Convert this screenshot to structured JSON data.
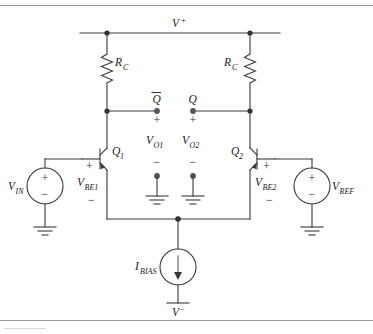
{
  "figure": {
    "accent_color": "#3a3a3a",
    "background_color": "#ffffff"
  },
  "rails": {
    "positive": {
      "label": "V",
      "sign": "+",
      "name": "v-plus-rail"
    },
    "negative": {
      "label": "V",
      "sign": "−",
      "name": "v-minus-rail"
    }
  },
  "resistors": [
    {
      "id": "rc-left",
      "label": "R",
      "subscript": "C"
    },
    {
      "id": "rc-right",
      "label": "R",
      "subscript": "C"
    }
  ],
  "transistors": [
    {
      "id": "q1",
      "label": "Q",
      "subscript": "1",
      "vbe_label": "V",
      "vbe_subscript": "BE1",
      "plus": "+",
      "minus": "−"
    },
    {
      "id": "q2",
      "label": "Q",
      "subscript": "2",
      "vbe_label": "V",
      "vbe_subscript": "BE2",
      "plus": "+",
      "minus": "−"
    }
  ],
  "outputs": [
    {
      "id": "out-qbar",
      "node_label": "Q",
      "overline": true,
      "plus": "+",
      "minus": "−",
      "voltage_label": "V",
      "voltage_subscript": "O1"
    },
    {
      "id": "out-q",
      "node_label": "Q",
      "overline": false,
      "plus": "+",
      "minus": "−",
      "voltage_label": "V",
      "voltage_subscript": "O2"
    }
  ],
  "sources": [
    {
      "id": "vin",
      "label": "V",
      "subscript": "IN",
      "plus": "+",
      "minus": "−",
      "type": "voltage"
    },
    {
      "id": "vref",
      "label": "V",
      "subscript": "REF",
      "plus": "+",
      "minus": "−",
      "type": "voltage"
    },
    {
      "id": "ibias",
      "label": "I",
      "subscript": "BIAS",
      "type": "current",
      "direction": "down"
    }
  ],
  "grounds": [
    {
      "id": "gnd-vin"
    },
    {
      "id": "gnd-vref"
    },
    {
      "id": "gnd-vo1"
    },
    {
      "id": "gnd-vo2"
    }
  ]
}
